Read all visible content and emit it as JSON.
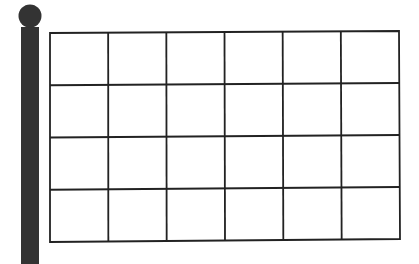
{
  "colors": {
    "background": "#ffffff",
    "pole": "#333333",
    "grid_line": "#222222",
    "flag_fill": "#ffffff"
  },
  "pole": {
    "finial": {
      "cx": 30,
      "cy": 16,
      "r": 11.5
    },
    "shaft": {
      "x": 21,
      "y": 27,
      "width": 18,
      "height": 237
    }
  },
  "flag": {
    "corners": {
      "top_left": [
        50,
        33
      ],
      "top_right": [
        399,
        31
      ],
      "bottom_right": [
        400,
        239
      ],
      "bottom_left": [
        50,
        242
      ]
    },
    "columns": 6,
    "rows": 4,
    "stroke_width": 1.8
  }
}
